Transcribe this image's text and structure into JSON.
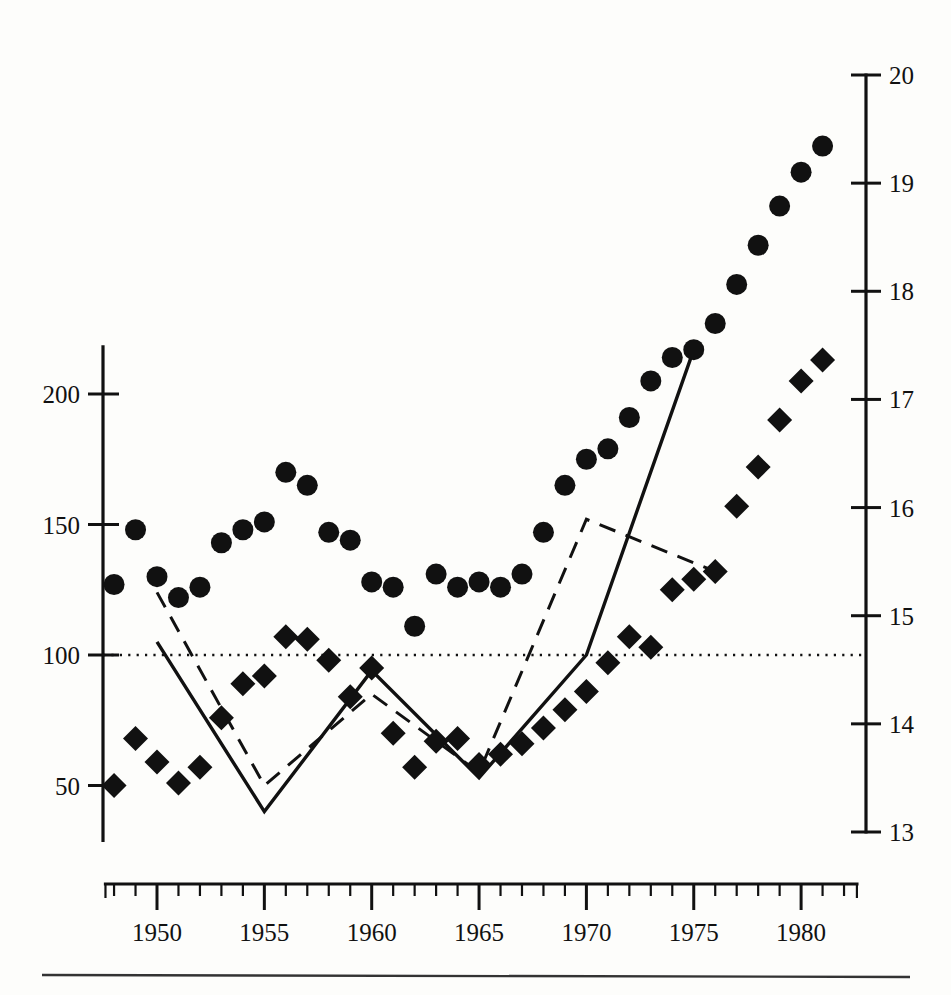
{
  "chart_data": {
    "type": "scatter",
    "title": "",
    "subtitle": "",
    "xlabel": "",
    "ylabel": "",
    "xlim": [
      1947.6,
      1982.6
    ],
    "grid": false,
    "legend": "none",
    "axes": {
      "x": {
        "major_ticks": [
          1950,
          1955,
          1960,
          1965,
          1970,
          1975,
          1980
        ],
        "major_tick_labels": [
          "1950",
          "1955",
          "1960",
          "1965",
          "1970",
          "1975",
          "1980"
        ],
        "minor_tick_step": 1,
        "minor_tick_range": [
          1948,
          1982
        ]
      },
      "y_left": {
        "ticks": [
          50,
          100,
          150,
          200
        ],
        "tick_labels": [
          "50",
          "100",
          "150",
          "200"
        ],
        "range": [
          32,
          215
        ],
        "position": "left"
      },
      "y_right": {
        "ticks": [
          13,
          14,
          15,
          16,
          17,
          18,
          19,
          20
        ],
        "tick_labels": [
          "13",
          "14",
          "15",
          "16",
          "17",
          "18",
          "19",
          "20"
        ],
        "range": [
          13,
          20
        ],
        "position": "right"
      }
    },
    "reference_line": {
      "value": 100,
      "axis": "y_left",
      "style": "dotted"
    },
    "series": [
      {
        "name": "circle-series",
        "marker": "circle",
        "axis": "y_left",
        "x": [
          1948,
          1949,
          1950,
          1951,
          1952,
          1953,
          1954,
          1955,
          1956,
          1957,
          1958,
          1959,
          1960,
          1961,
          1962,
          1963,
          1964,
          1965,
          1966,
          1967,
          1968,
          1969,
          1970,
          1971,
          1972,
          1973,
          1974,
          1975,
          1976,
          1977,
          1978,
          1979,
          1980,
          1981
        ],
        "values": [
          127,
          148,
          130,
          122,
          126,
          143,
          148,
          151,
          170,
          165,
          147,
          144,
          128,
          126,
          111,
          131,
          126,
          128,
          126,
          131,
          147,
          165,
          175,
          179,
          191,
          205,
          214,
          217,
          227,
          242,
          257,
          272,
          285,
          295
        ]
      },
      {
        "name": "diamond-series",
        "marker": "diamond",
        "axis": "y_left",
        "x": [
          1948,
          1949,
          1950,
          1951,
          1952,
          1953,
          1954,
          1955,
          1956,
          1957,
          1958,
          1959,
          1960,
          1961,
          1962,
          1963,
          1964,
          1965,
          1966,
          1967,
          1968,
          1969,
          1970,
          1971,
          1972,
          1973,
          1974,
          1975,
          1976,
          1977,
          1978,
          1979,
          1980,
          1981
        ],
        "values": [
          50,
          68,
          59,
          51,
          57,
          76,
          89,
          92,
          107,
          106,
          98,
          84,
          95,
          70,
          57,
          67,
          68,
          58,
          62,
          66,
          72,
          79,
          86,
          97,
          107,
          103,
          125,
          129,
          132,
          157,
          172,
          190,
          205,
          213
        ]
      },
      {
        "name": "solid-line",
        "marker": "none",
        "style": "solid",
        "axis": "y_left",
        "x": [
          1950,
          1955,
          1960,
          1965,
          1970,
          1975
        ],
        "values": [
          105,
          40,
          94,
          53,
          100,
          217
        ]
      },
      {
        "name": "dashed-line",
        "marker": "none",
        "style": "dashed",
        "axis": "y_left",
        "x": [
          1950,
          1955,
          1960,
          1965,
          1970,
          1976
        ],
        "values": [
          124,
          50,
          85,
          55,
          152,
          132
        ]
      }
    ]
  },
  "footer": {
    "rule": true
  }
}
